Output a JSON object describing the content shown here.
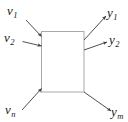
{
  "diagram": {
    "type": "block-diagram",
    "background_color": "#ffffff",
    "block": {
      "name": "system-block",
      "fill": "#ffffff",
      "stroke": "#a9a9a9",
      "stroke_width": 1,
      "x": 41,
      "y": 31,
      "width": 43,
      "height": 61
    },
    "arrow_color": "#3c3c3c",
    "inputs": [
      {
        "id": "v1",
        "symbol": "v",
        "subscript": "1",
        "direction": "into-block",
        "from": [
          26,
          20
        ],
        "to": [
          42,
          37
        ]
      },
      {
        "id": "v2",
        "symbol": "v",
        "subscript": "2",
        "direction": "into-block",
        "from": [
          22,
          41
        ],
        "to": [
          42,
          46
        ]
      },
      {
        "id": "vn",
        "symbol": "v",
        "subscript": "n",
        "direction": "into-block",
        "from": [
          22,
          110
        ],
        "to": [
          42,
          89
        ]
      }
    ],
    "outputs": [
      {
        "id": "y1",
        "symbol": "y",
        "subscript": "1",
        "direction": "out-of-block",
        "from": [
          84,
          40
        ],
        "to": [
          107,
          16
        ]
      },
      {
        "id": "y2",
        "symbol": "y",
        "subscript": "2",
        "direction": "out-of-block",
        "from": [
          84,
          50
        ],
        "to": [
          108,
          42
        ]
      },
      {
        "id": "ym",
        "symbol": "y",
        "subscript": "m",
        "direction": "out-of-block",
        "from": [
          84,
          92
        ],
        "to": [
          112,
          112
        ]
      }
    ]
  }
}
